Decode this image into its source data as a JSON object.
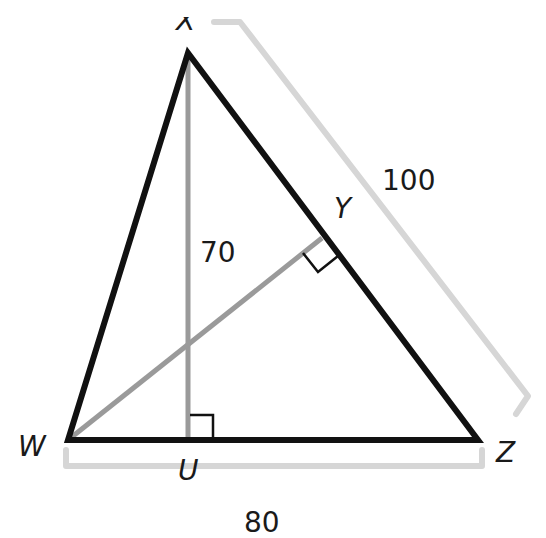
{
  "diagram": {
    "type": "triangle-with-altitudes",
    "vertices": {
      "X": {
        "label": "X",
        "x": 188,
        "y": 53
      },
      "W": {
        "label": "W",
        "x": 68,
        "y": 440
      },
      "Z": {
        "label": "Z",
        "x": 478,
        "y": 440
      }
    },
    "feet": {
      "U": {
        "label": "U",
        "x": 188,
        "y": 440
      },
      "Y": {
        "label": "Y",
        "x": 322,
        "y": 238
      }
    },
    "measurements": {
      "altitude_XU": "70",
      "side_XZ": "100",
      "side_WZ": "80"
    },
    "colors": {
      "triangle": "#111111",
      "altitude": "#9a9a9a",
      "bracket": "#d6d6d6",
      "text": "#1a1a1a"
    }
  }
}
